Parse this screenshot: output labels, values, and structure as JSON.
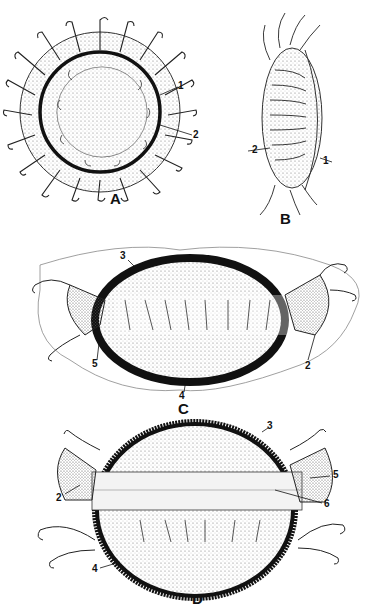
{
  "figures": [
    {
      "id": "A",
      "label": "A",
      "view": "oral view, circular medusa with marginal tentacles",
      "callouts": [
        "1",
        "2"
      ]
    },
    {
      "id": "B",
      "label": "B",
      "view": "lateral view",
      "callouts": [
        "1",
        "2"
      ]
    },
    {
      "id": "C",
      "label": "C",
      "view": "flattened oval body with lateral fan-shaped lobes",
      "callouts": [
        "2",
        "3",
        "4",
        "5"
      ]
    },
    {
      "id": "D",
      "label": "D",
      "view": "oval body with spiny rim and band",
      "callouts": [
        "2",
        "3",
        "4",
        "5",
        "6"
      ]
    }
  ],
  "colors": {
    "ink": "#111111",
    "paper": "#ffffff",
    "stipple": "#9a9a9a"
  }
}
